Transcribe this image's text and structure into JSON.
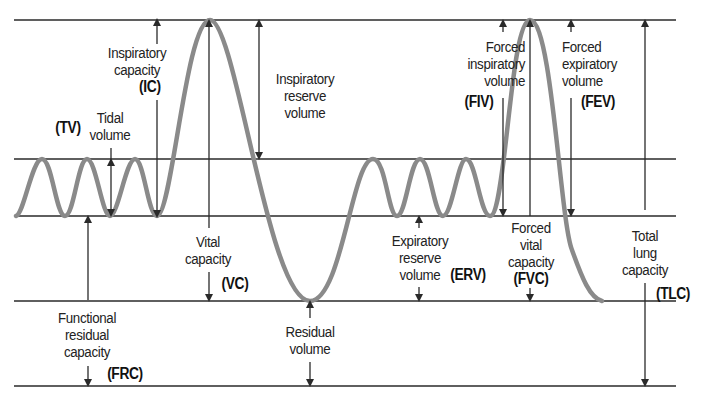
{
  "diagram": {
    "colors": {
      "background": "#ffffff",
      "lines": "#2a2a2a",
      "waveform": "#8a8a8a",
      "text": "#222222"
    },
    "levels": {
      "max_inspiration_y": 20,
      "end_tidal_inspiration_y": 159,
      "end_tidal_expiration_y": 216,
      "max_expiration_y": 301,
      "zero_volume_y": 386
    },
    "labels": {
      "ic": {
        "lines": [
          "Inspiratory",
          "capacity"
        ],
        "abbr": "(IC)"
      },
      "tv": {
        "lines": [
          "Tidal",
          "volume"
        ],
        "abbr": "(TV)"
      },
      "irv": {
        "lines": [
          "Inspiratory",
          "reserve",
          "volume"
        ]
      },
      "vc": {
        "lines": [
          "Vital",
          "capacity"
        ],
        "abbr": "(VC)"
      },
      "frc": {
        "lines": [
          "Functional",
          "residual",
          "capacity"
        ],
        "abbr": "(FRC)"
      },
      "rv": {
        "lines": [
          "Residual",
          "volume"
        ]
      },
      "erv": {
        "lines": [
          "Expiratory",
          "reserve",
          "volume"
        ],
        "abbr": "(ERV)"
      },
      "fiv": {
        "lines": [
          "Forced",
          "inspiratory",
          "volume"
        ],
        "abbr": "(FIV)"
      },
      "fev": {
        "lines": [
          "Forced",
          "expiratory",
          "volume"
        ],
        "abbr": "(FEV)"
      },
      "fvc": {
        "lines": [
          "Forced",
          "vital",
          "capacity"
        ],
        "abbr": "(FVC)"
      },
      "tlc": {
        "lines": [
          "Total",
          "lung",
          "capacity"
        ],
        "abbr": "(TLC)"
      }
    }
  }
}
